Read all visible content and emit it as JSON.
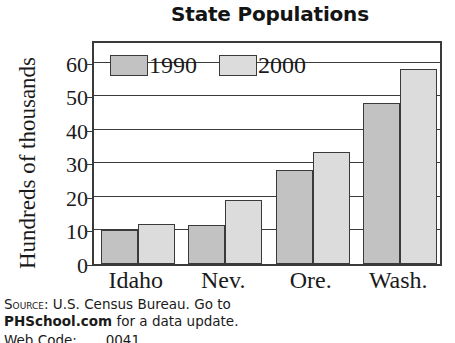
{
  "chart_data": {
    "type": "bar",
    "title": "State Populations",
    "xlabel": "",
    "ylabel": "Hundreds of thousands",
    "categories": [
      "Idaho",
      "Nev.",
      "Ore.",
      "Wash."
    ],
    "series": [
      {
        "name": "1990",
        "color": "#c2c2c2",
        "values": [
          10,
          11.5,
          28,
          48
        ]
      },
      {
        "name": "2000",
        "color": "#dcdcdc",
        "values": [
          12,
          19,
          33.5,
          58
        ]
      }
    ],
    "yticks": [
      0,
      10,
      20,
      30,
      40,
      50,
      60
    ],
    "ylim": [
      0,
      67
    ],
    "grid": true,
    "legend_position": "inside-top-left"
  },
  "legend": {
    "entries": [
      {
        "label": "1990",
        "color": "#c2c2c2"
      },
      {
        "label": "2000",
        "color": "#dcdcdc"
      }
    ]
  },
  "source": {
    "label": "Source:",
    "line1_rest": " U.S. Census Bureau. Go to",
    "line2_bold": "PHSchool.com",
    "line2_rest": " for a data update.",
    "line3": "Web Code: ___ 0041"
  },
  "colors": {
    "axis": "#3a3a3a",
    "text": "#1a1a1a",
    "series_1990": "#c2c2c2",
    "series_2000": "#dcdcdc",
    "background": "#ffffff"
  }
}
